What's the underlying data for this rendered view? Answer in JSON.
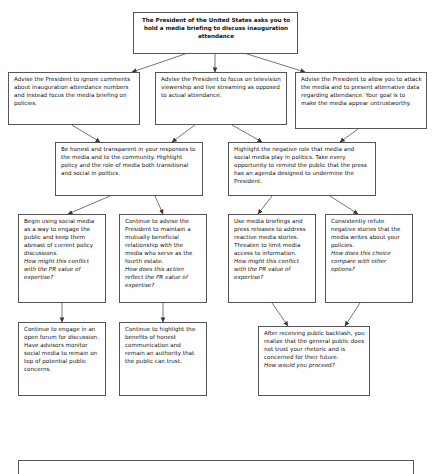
{
  "diagram": {
    "type": "decision-tree-flowchart",
    "title_node": {
      "id": "root",
      "text": "The President of the United States asks you to hold a media briefing to discuss inauguration attendance"
    },
    "level2": [
      {
        "id": "l2-a",
        "text": "Advise the President to ignore comments about inauguration attendance numbers and instead focus the media briefing on policies."
      },
      {
        "id": "l2-b",
        "text": "Advise the President to focus on television viewership and live streaming as opposed to actual attendance."
      },
      {
        "id": "l2-c",
        "text": "Advise the President to allow you to attack the media and to present alternative data regarding attendance. Your goal is to make the media appear untrustworthy."
      }
    ],
    "level3": [
      {
        "id": "l3-a",
        "text": "Be honest and transparent in your responses to the media and to the community. Highlight policy and the role of media both transitional and social in politics."
      },
      {
        "id": "l3-b",
        "text": "Highlight the negative role that media and social media play in politics. Take every opportunity to remind the public that the press has an agenda designed to undermine the President."
      }
    ],
    "level4": [
      {
        "id": "l4-a",
        "text": "Begin using social media as a way to engage the public and keep them abreast of current policy discussions.",
        "question": "How might this conflict with the PR value of expertise?"
      },
      {
        "id": "l4-b",
        "text": "Continue to advise the President to maintain a mutually beneficial relationship with the media who serve as the fourth estate.",
        "question": "How does this action reflect the PR value of expertise?"
      },
      {
        "id": "l4-c",
        "text": "Use media briefings and press releases to address reactive media stories. Threaten to limit media access to information.",
        "question": "How might this conflict with the PR value of expertise?"
      },
      {
        "id": "l4-d",
        "text": "Consistently refute negative stories that the media writes about your policies.",
        "question": "How does this choice compare with other options?"
      }
    ],
    "level5": [
      {
        "id": "l5-a",
        "text": "Continue to engage in an open forum for discussion. Have advisors monitor social media to remain on top of potential public concerns.",
        "question": ""
      },
      {
        "id": "l5-b",
        "text": "Continue to highlight the benefits of honest communication and remain an authority that the public can trust.",
        "question": ""
      },
      {
        "id": "l5-c",
        "text": "After receiving public backlash, you realize that the general public does not trust your rhetoric and is concerned for their future.",
        "question": "How would you proceed?"
      }
    ],
    "footer_node": {
      "id": "footer",
      "text": ""
    },
    "style": {
      "box_border_color": "#555555",
      "box_fill": "#ffffff",
      "connector_color": "#444444",
      "text_color": "#111111"
    }
  }
}
